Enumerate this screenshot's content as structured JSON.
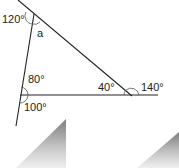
{
  "diagram": {
    "labels": {
      "top_exterior": "120°",
      "top_interior": "a",
      "left_interior": "80°",
      "left_exterior": "100°",
      "right_interior": "40°",
      "right_exterior": "140°"
    },
    "colors": {
      "line": "#222222",
      "arc": "#555555",
      "gradient_dark": "#8a8a8a",
      "gradient_light": "#f2f2f2"
    }
  }
}
